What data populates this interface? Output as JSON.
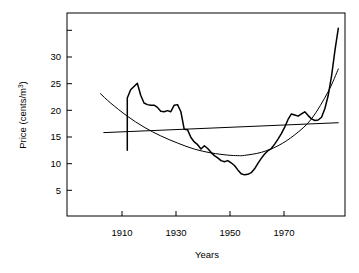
{
  "chart_data": {
    "type": "line",
    "title": "",
    "xlabel": "Years",
    "ylabel": "Price (cents/m",
    "ylabel_sup": "3",
    "ylabel_suffix": ")",
    "xlim": [
      1897,
      1980
    ],
    "ylim": [
      0,
      37
    ],
    "grid": false,
    "legend": "none",
    "xticks": [
      1910,
      1930,
      1950,
      1970
    ],
    "xtick_labels": [
      "1910",
      "1930",
      "1950",
      "1970"
    ],
    "yticks": [
      5,
      10,
      15,
      20,
      25,
      30,
      35
    ],
    "ytick_labels": [
      "5",
      "10",
      "15",
      "20",
      "25",
      "30",
      ""
    ],
    "series": [
      {
        "name": "observed-price",
        "style": "jagged-thick",
        "x": [
          1915,
          1915,
          1916,
          1917,
          1918,
          1919,
          1920,
          1921,
          1922,
          1923,
          1924,
          1925,
          1926,
          1927,
          1928,
          1929,
          1930,
          1931,
          1932,
          1933,
          1934,
          1935,
          1936,
          1937,
          1938,
          1939,
          1940,
          1941,
          1942,
          1943,
          1944,
          1945,
          1946,
          1947,
          1948,
          1949,
          1950,
          1951,
          1952,
          1953,
          1954,
          1955,
          1956,
          1957,
          1958,
          1959,
          1960,
          1961,
          1962,
          1963,
          1964,
          1965,
          1966,
          1967,
          1968,
          1969,
          1970,
          1971,
          1972,
          1973,
          1974,
          1975,
          1976,
          1977,
          1978
        ],
        "y": [
          12.0,
          21.5,
          23.0,
          23.6,
          24.2,
          22.0,
          20.6,
          20.3,
          20.2,
          20.2,
          19.8,
          19.1,
          19.0,
          19.2,
          19.0,
          20.2,
          20.3,
          19.0,
          15.8,
          15.7,
          14.3,
          13.5,
          13.0,
          12.2,
          12.8,
          12.3,
          11.6,
          11.0,
          10.6,
          10.1,
          9.9,
          10.1,
          9.7,
          9.2,
          8.4,
          7.7,
          7.5,
          7.6,
          7.9,
          8.6,
          9.6,
          10.5,
          11.3,
          11.9,
          12.3,
          13.1,
          14.0,
          15.0,
          16.2,
          17.6,
          18.6,
          18.4,
          18.2,
          18.6,
          19.0,
          18.3,
          17.7,
          17.4,
          17.5,
          18.0,
          19.6,
          22.0,
          25.6,
          30.2,
          34.2
        ]
      },
      {
        "name": "quadratic-trend",
        "style": "smooth-u",
        "x": [
          1907,
          1910,
          1915,
          1920,
          1925,
          1930,
          1935,
          1940,
          1945,
          1948,
          1950,
          1955,
          1960,
          1965,
          1970,
          1975,
          1978
        ],
        "y": [
          22.3,
          20.6,
          18.2,
          16.2,
          14.6,
          13.3,
          12.2,
          11.5,
          11.1,
          11.0,
          11.05,
          11.6,
          12.8,
          14.8,
          17.7,
          22.7,
          26.8
        ]
      },
      {
        "name": "linear-trend",
        "style": "near-flat-line",
        "x": [
          1908,
          1978
        ],
        "y": [
          15.2,
          17.0
        ]
      }
    ]
  },
  "axes": {
    "y_axis_label_full": "Price (cents/m3)",
    "x_axis_label": "Years"
  }
}
